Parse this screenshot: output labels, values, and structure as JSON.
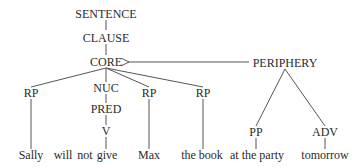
{
  "diagram": {
    "type": "syntax-tree",
    "nodes": {
      "sentence": "SENTENCE",
      "clause": "CLAUSE",
      "core": "CORE",
      "periphery": "PERIPHERY",
      "rp1": "RP",
      "nuc": "NUC",
      "rp2": "RP",
      "rp3": "RP",
      "pred": "PRED",
      "v": "V",
      "pp": "PP",
      "adv": "ADV"
    },
    "words": {
      "sally": "Sally",
      "will": "will",
      "not": "not",
      "give": "give",
      "max": "Max",
      "the_book": "the book",
      "at_the_party": "at the party",
      "tomorrow": "tomorrow"
    },
    "edges": [
      [
        "SENTENCE",
        "CLAUSE"
      ],
      [
        "CLAUSE",
        "CORE"
      ],
      [
        "CORE",
        "RP"
      ],
      [
        "CORE",
        "NUC"
      ],
      [
        "CORE",
        "RP"
      ],
      [
        "CORE",
        "RP"
      ],
      [
        "NUC",
        "PRED"
      ],
      [
        "PRED",
        "V"
      ],
      [
        "PERIPHERY",
        "CORE",
        "arrow"
      ],
      [
        "PERIPHERY",
        "PP"
      ],
      [
        "PERIPHERY",
        "ADV"
      ],
      [
        "RP",
        "Sally"
      ],
      [
        "V",
        "give"
      ],
      [
        "RP",
        "Max"
      ],
      [
        "RP",
        "the book"
      ],
      [
        "PP",
        "at the party"
      ],
      [
        "ADV",
        "tomorrow"
      ]
    ],
    "colors": {
      "line": "#555555",
      "text": "#2a2a2a"
    }
  }
}
